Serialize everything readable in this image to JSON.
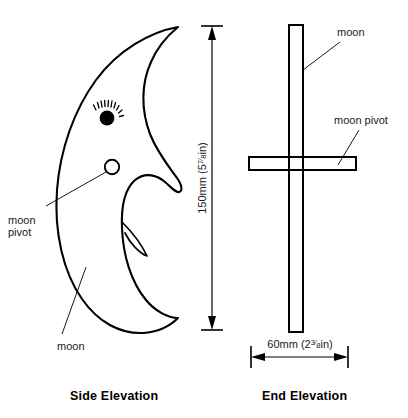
{
  "drawing": {
    "title": "Moon cut-out woodworking plan",
    "line_color": "#000000",
    "background_color": "#ffffff"
  },
  "side_elevation": {
    "caption": "Side Elevation",
    "callouts": [
      {
        "id": "pivot",
        "label_line1": "moon",
        "label_line2": "pivot"
      },
      {
        "id": "moon",
        "label_line1": "moon",
        "label_line2": ""
      }
    ],
    "features": {
      "eye_name": "eye",
      "pivot_hole_name": "moon-pivot-hole"
    }
  },
  "end_elevation": {
    "caption": "End Elevation",
    "callouts": [
      {
        "id": "moon",
        "label": "moon"
      },
      {
        "id": "moon_pivot",
        "label": "moon pivot"
      }
    ]
  },
  "dimensions": {
    "height": {
      "value_mm": "150mm",
      "value_in_whole": "5",
      "value_in_frac": "7/8",
      "value_in_unit": "in",
      "full_text": "150mm (5 7/8 in)",
      "orientation": "vertical"
    },
    "width": {
      "value_mm": "60mm",
      "value_in_whole": "2",
      "value_in_frac": "3/8",
      "value_in_unit": "in",
      "full_text": "60mm (2 3/8 in)",
      "orientation": "horizontal"
    }
  }
}
